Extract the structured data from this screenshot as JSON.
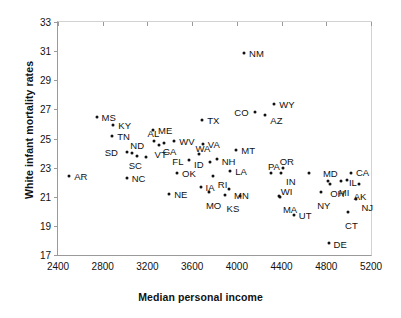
{
  "chart_data": {
    "type": "scatter",
    "title": "",
    "xlabel": "Median personal income",
    "ylabel": "White infant mortality rates",
    "xlim": [
      2400,
      5200
    ],
    "ylim": [
      17,
      33
    ],
    "xticks": [
      2400,
      2800,
      3200,
      3600,
      4000,
      4400,
      4800,
      5200
    ],
    "yticks": [
      17,
      19,
      21,
      23,
      25,
      27,
      29,
      31,
      33
    ],
    "grid": false,
    "legend": null,
    "marker_color": "#111111",
    "points": [
      {
        "label": "AR",
        "x": 2500,
        "y": 22.4,
        "lx": 5,
        "ly": -4
      },
      {
        "label": "MS",
        "x": 2745,
        "y": 26.5,
        "lx": 5,
        "ly": -4
      },
      {
        "label": "KY",
        "x": 2895,
        "y": 25.9,
        "lx": 5,
        "ly": -4
      },
      {
        "label": "TN",
        "x": 2885,
        "y": 25.2,
        "lx": 5,
        "ly": -4
      },
      {
        "label": "SD",
        "x": 3015,
        "y": 24.1,
        "lx": -22,
        "ly": -4
      },
      {
        "label": "ND",
        "x": 3065,
        "y": 24.0,
        "lx": -2,
        "ly": -12
      },
      {
        "label": "NC",
        "x": 3015,
        "y": 22.3,
        "lx": 5,
        "ly": -4
      },
      {
        "label": "SC",
        "x": 3185,
        "y": 23.75,
        "lx": -17,
        "ly": 4
      },
      {
        "label": "AL",
        "x": 3255,
        "y": 24.8,
        "lx": -6,
        "ly": -12
      },
      {
        "label": "ME",
        "x": 3250,
        "y": 25.55,
        "lx": 5,
        "ly": -4
      },
      {
        "label": "VT",
        "x": 3300,
        "y": 24.55,
        "lx": -4,
        "ly": 5
      },
      {
        "label": "GA",
        "x": 3345,
        "y": 24.7,
        "lx": -1,
        "ly": 4
      },
      {
        "label": "OK",
        "x": 3465,
        "y": 22.65,
        "lx": 5,
        "ly": -4
      },
      {
        "label": "WV",
        "x": 3440,
        "y": 24.85,
        "lx": 5,
        "ly": -4
      },
      {
        "label": "NE",
        "x": 3395,
        "y": 21.2,
        "lx": 5,
        "ly": -4
      },
      {
        "label": "FL",
        "x": 3575,
        "y": 23.5,
        "lx": -17,
        "ly": -3
      },
      {
        "label": "TX",
        "x": 3690,
        "y": 26.3,
        "lx": 5,
        "ly": -4
      },
      {
        "label": "WA",
        "x": 3665,
        "y": 23.95,
        "lx": -4,
        "ly": -10
      },
      {
        "label": "VA",
        "x": 3695,
        "y": 24.65,
        "lx": 5,
        "ly": -4
      },
      {
        "label": "ID",
        "x": 3760,
        "y": 23.4,
        "lx": -16,
        "ly": -2
      },
      {
        "label": "IA",
        "x": 3675,
        "y": 21.65,
        "lx": 5,
        "ly": -4
      },
      {
        "label": "MO",
        "x": 3750,
        "y": 21.35,
        "lx": -3,
        "ly": 9
      },
      {
        "label": "RI",
        "x": 3785,
        "y": 22.4,
        "lx": 5,
        "ly": 4
      },
      {
        "label": "NH",
        "x": 3820,
        "y": 23.6,
        "lx": 5,
        "ly": -2
      },
      {
        "label": "MT",
        "x": 3995,
        "y": 24.2,
        "lx": 5,
        "ly": -4
      },
      {
        "label": "LA",
        "x": 3940,
        "y": 22.75,
        "lx": 5,
        "ly": -4
      },
      {
        "label": "KS",
        "x": 3890,
        "y": 21.1,
        "lx": 2,
        "ly": 9
      },
      {
        "label": "MN",
        "x": 3930,
        "y": 21.5,
        "lx": 5,
        "ly": 2
      },
      {
        "label": "NM",
        "x": 4065,
        "y": 30.85,
        "lx": 5,
        "ly": -4
      },
      {
        "label": "CO",
        "x": 4165,
        "y": 26.8,
        "lx": -21,
        "ly": -4
      },
      {
        "label": "AZ",
        "x": 4255,
        "y": 26.6,
        "lx": 5,
        "ly": 1
      },
      {
        "label": "WY",
        "x": 4335,
        "y": 27.4,
        "lx": 5,
        "ly": -4
      },
      {
        "label": "PA",
        "x": 4305,
        "y": 22.6,
        "lx": -3,
        "ly": -11
      },
      {
        "label": "OR",
        "x": 4410,
        "y": 22.95,
        "lx": -3,
        "ly": -11
      },
      {
        "label": "IN",
        "x": 4395,
        "y": 22.6,
        "lx": 5,
        "ly": 4
      },
      {
        "label": "WI",
        "x": 4375,
        "y": 21.05,
        "lx": 2,
        "ly": -9
      },
      {
        "label": "MA",
        "x": 4385,
        "y": 20.95,
        "lx": 3,
        "ly": 8
      },
      {
        "label": "UT",
        "x": 4510,
        "y": 19.75,
        "lx": 5,
        "ly": -4
      },
      {
        "label": "NY",
        "x": 4755,
        "y": 21.35,
        "lx": -4,
        "ly": 9
      },
      {
        "label": "MD",
        "x": 4815,
        "y": 22.1,
        "lx": -5,
        "ly": -12
      },
      {
        "label": "OH",
        "x": 4835,
        "y": 21.9,
        "lx": 0,
        "ly": 5
      },
      {
        "label": "MI",
        "x": 4930,
        "y": 22.1,
        "lx": -2,
        "ly": 7
      },
      {
        "label": "IL",
        "x": 4985,
        "y": 22.15,
        "lx": 2,
        "ly": -2
      },
      {
        "label": "CA",
        "x": 5020,
        "y": 22.65,
        "lx": 5,
        "ly": -5
      },
      {
        "label": "AK",
        "x": 5090,
        "y": 21.9,
        "lx": -5,
        "ly": 8
      },
      {
        "label": "NJ",
        "x": 5070,
        "y": 20.85,
        "lx": 5,
        "ly": 4
      },
      {
        "label": "CT",
        "x": 4995,
        "y": 19.95,
        "lx": -3,
        "ly": 9
      },
      {
        "label": "DE",
        "x": 4820,
        "y": 17.8,
        "lx": 5,
        "ly": -3
      },
      {
        "label": "",
        "x": 4645,
        "y": 22.65,
        "lx": 0,
        "ly": 0
      },
      {
        "label": "",
        "x": 4025,
        "y": 21.05,
        "lx": 0,
        "ly": 0
      },
      {
        "label": "",
        "x": 3105,
        "y": 23.8,
        "lx": 0,
        "ly": 0
      }
    ]
  }
}
